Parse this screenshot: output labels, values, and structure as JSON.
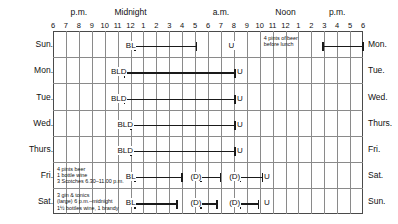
{
  "chart_data": {
    "type": "table",
    "title": "",
    "xlabel": "",
    "ylabel": "",
    "axis": {
      "periods": [
        {
          "label": "p.m.",
          "hour_index": 2
        },
        {
          "label": "Midnight",
          "hour_index": 6
        },
        {
          "label": "a.m.",
          "hour_index": 13
        },
        {
          "label": "Noon",
          "hour_index": 18
        },
        {
          "label": "p.m.",
          "hour_index": 22
        }
      ],
      "hours": [
        "6",
        "7",
        "8",
        "9",
        "10",
        "11",
        "12",
        "1",
        "2",
        "3",
        "4",
        "5",
        "6",
        "7",
        "8",
        "9",
        "10",
        "11",
        "12",
        "1",
        "2",
        "3",
        "4",
        "5",
        "6"
      ],
      "hour_count": 25,
      "start_hour_label": "6",
      "end_hour_label": "6",
      "grid": true
    },
    "rows": [
      {
        "left_label": "Sun.",
        "right_label": "Mon.",
        "codes": [
          {
            "text": "BL",
            "hour_index": 5.6
          },
          {
            "text": "U",
            "hour_index": 13.55
          }
        ],
        "bars": [
          {
            "start_hour_index": 6.35,
            "end_hour_index": 11.1
          },
          {
            "start_hour_index": 20.9,
            "end_hour_index": 24.0
          }
        ],
        "notes": [
          {
            "lines": [
              "4 pints of beer",
              "before lunch"
            ],
            "hour_index": 16.2
          }
        ]
      },
      {
        "left_label": "Mon.",
        "right_label": "Tue.",
        "codes": [
          {
            "text": "BLD",
            "hour_index": 4.45
          },
          {
            "text": "U",
            "hour_index": 14.2
          }
        ],
        "bars": [
          {
            "start_hour_index": 5.55,
            "end_hour_index": 14.1
          }
        ],
        "notes": []
      },
      {
        "left_label": "Tue.",
        "right_label": "Wed.",
        "codes": [
          {
            "text": "BLD",
            "hour_index": 4.45
          },
          {
            "text": "U",
            "hour_index": 14.2
          }
        ],
        "bars": [
          {
            "start_hour_index": 5.55,
            "end_hour_index": 14.1
          }
        ],
        "notes": []
      },
      {
        "left_label": "Wed.",
        "right_label": "Thurs.",
        "codes": [
          {
            "text": "BLD",
            "hour_index": 4.95
          },
          {
            "text": "U",
            "hour_index": 14.2
          }
        ],
        "bars": [
          {
            "start_hour_index": 6.05,
            "end_hour_index": 14.1
          }
        ],
        "notes": []
      },
      {
        "left_label": "Thurs.",
        "right_label": "Fri.",
        "codes": [
          {
            "text": "BLD",
            "hour_index": 4.95
          },
          {
            "text": "U",
            "hour_index": 14.2
          }
        ],
        "bars": [
          {
            "start_hour_index": 6.05,
            "end_hour_index": 14.1
          }
        ],
        "notes": []
      },
      {
        "left_label": "Fri.",
        "right_label": "Sat.",
        "codes": [
          {
            "text": "BL",
            "hour_index": 5.6
          },
          {
            "text": "(D)",
            "hour_index": 10.6
          },
          {
            "text": "(D)",
            "hour_index": 13.6
          },
          {
            "text": "U",
            "hour_index": 16.3
          }
        ],
        "bars": [
          {
            "start_hour_index": 6.35,
            "end_hour_index": 10.0
          },
          {
            "start_hour_index": 11.45,
            "end_hour_index": 12.95
          },
          {
            "start_hour_index": 14.5,
            "end_hour_index": 16.2
          }
        ],
        "notes": [
          {
            "lines": [
              "4 pints beer",
              "1 bottle wine",
              "3 Scotches 6.30–11.00 p.m."
            ],
            "hour_index": 0.2
          }
        ]
      },
      {
        "left_label": "Sat.",
        "right_label": "Sun.",
        "codes": [
          {
            "text": "BL",
            "hour_index": 5.6
          },
          {
            "text": "(D)",
            "hour_index": 10.6
          },
          {
            "text": "(D)",
            "hour_index": 13.6
          },
          {
            "text": "U",
            "hour_index": 16.3
          }
        ],
        "bars": [
          {
            "start_hour_index": 6.35,
            "end_hour_index": 9.6
          },
          {
            "start_hour_index": 11.45,
            "end_hour_index": 12.7
          },
          {
            "start_hour_index": 14.5,
            "end_hour_index": 15.9
          }
        ],
        "notes": [
          {
            "lines": [
              "3 gin & tonics",
              "(large) 6 p.m.–midnight",
              "1½ bottles wine, 1 brandy"
            ],
            "hour_index": 0.2
          }
        ]
      }
    ],
    "colors": {
      "bar": "#1a1a1a",
      "grid": "#8a8a8a",
      "frame": "#4a4a4a",
      "text": "#111111",
      "background": "#ffffff"
    }
  }
}
